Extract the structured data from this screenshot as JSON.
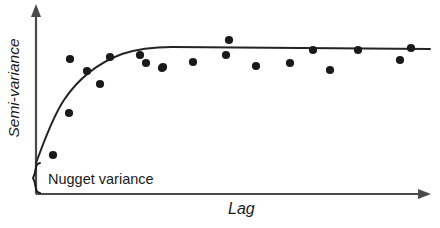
{
  "figure": {
    "background_color": "#ffffff",
    "ink_color": "#1a1a1a",
    "axis_color": "#4a4a4a"
  },
  "labels": {
    "y_axis": "Semi-variance",
    "x_axis": "Lag",
    "annotation": "Nugget variance"
  },
  "icons": {
    "y_axis_arrow": "arrow-up-icon",
    "x_axis_arrow": "arrow-right-icon",
    "brace": "curly-brace-icon"
  },
  "chart_data": {
    "type": "scatter",
    "title": "",
    "xlabel": "Lag",
    "ylabel": "Semi-variance",
    "grid": false,
    "legend": false,
    "axis_ticks": false,
    "xlim": [
      0,
      1
    ],
    "ylim": [
      0,
      1
    ],
    "annotations": [
      {
        "text": "Nugget variance",
        "marker": "curly-brace",
        "describes": "non-zero intercept of the fitted model at zero lag"
      }
    ],
    "series": [
      {
        "name": "Empirical semivariance",
        "type": "scatter",
        "marker": "filled-circle",
        "marker_color": "#1a1a1a",
        "marker_radius_px": 4.1,
        "points_px": [
          [
            53,
            155
          ],
          [
            69,
            113
          ],
          [
            70,
            59
          ],
          [
            87,
            71
          ],
          [
            100,
            84
          ],
          [
            110,
            57
          ],
          [
            140,
            55
          ],
          [
            146,
            63
          ],
          [
            162,
            68
          ],
          [
            163,
            67
          ],
          [
            193,
            62
          ],
          [
            229,
            40
          ],
          [
            256,
            66
          ],
          [
            290,
            63
          ],
          [
            313,
            50
          ],
          [
            330,
            70
          ],
          [
            358,
            50
          ],
          [
            400,
            60
          ],
          [
            411,
            48
          ],
          [
            226,
            55
          ]
        ]
      },
      {
        "name": "Fitted exponential model",
        "type": "line",
        "line_color": "#242424",
        "line_width_px": 2.0,
        "nugget_px_y": 163,
        "sill_px_y": 48,
        "range_px_x": 165,
        "path_px": "M 36,163 C 44,142 52,118 64,100 C 78,79 98,63 122,54 C 140,48 155,47 172,47 L 430,49"
      }
    ],
    "geometry_px": {
      "y_axis_x": 36,
      "y_axis_top": 5,
      "x_axis_y": 194,
      "x_axis_right": 430,
      "origin": [
        36,
        194
      ]
    }
  }
}
